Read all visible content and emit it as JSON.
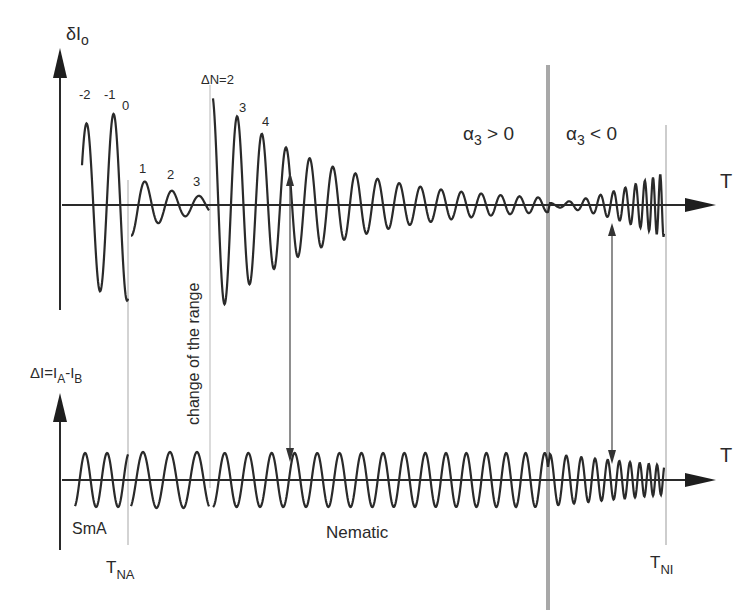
{
  "figure": {
    "top_panel": {
      "y_axis_label": "δI",
      "y_axis_label_sub": "o",
      "x_axis_label": "T",
      "peak_labels": [
        "-2",
        "-1",
        "0",
        "1",
        "2",
        "3"
      ],
      "delta_n_label": "ΔN=2",
      "post_change_labels": [
        "3",
        "4"
      ],
      "alpha_pos_label": "α",
      "alpha_pos_sub": "3",
      "alpha_pos_rel": " > 0",
      "alpha_neg_label": "α",
      "alpha_neg_sub": "3",
      "alpha_neg_rel": " < 0"
    },
    "bottom_panel": {
      "y_axis_label_main": "ΔI=I",
      "y_axis_label_sub_a": "A",
      "y_axis_label_dash": "-I",
      "y_axis_label_sub_b": "B",
      "x_axis_label": "T",
      "phase_smA": "SmA",
      "phase_nematic": "Nematic"
    },
    "markers": {
      "change_of_range": "change of the range",
      "t_na_main": "T",
      "t_na_sub": "NA",
      "t_ni_main": "T",
      "t_ni_sub": "NI"
    },
    "colors": {
      "curve": "#2a2a2a",
      "thin_separator": "#bdbdbd",
      "thick_separator": "#a8a8a8"
    }
  }
}
